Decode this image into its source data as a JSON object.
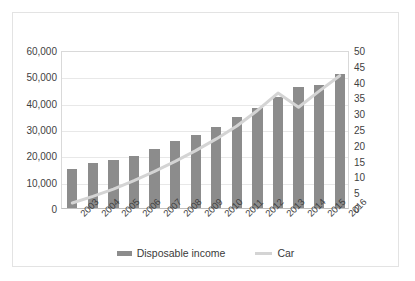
{
  "chart_data": {
    "type": "bar",
    "title": "",
    "xlabel": "",
    "ylabel": "",
    "grid": true,
    "legend_position": "bottom-center",
    "categories": [
      "2003",
      "2004",
      "2005",
      "2006",
      "2007",
      "2008",
      "2009",
      "2010",
      "2011",
      "2012",
      "2013",
      "2014",
      "2015",
      "2016"
    ],
    "axes": {
      "left": {
        "label": "",
        "ylim": [
          0,
          60000
        ],
        "step": 10000,
        "ticks": [
          "0",
          "10,000",
          "20,000",
          "30,000",
          "40,000",
          "50,000",
          "60,000"
        ],
        "tick_values": [
          0,
          10000,
          20000,
          30000,
          40000,
          50000,
          60000
        ]
      },
      "right": {
        "label": "",
        "ylim": [
          0,
          50
        ],
        "step": 5,
        "ticks": [
          "0",
          "5",
          "10",
          "15",
          "20",
          "25",
          "30",
          "35",
          "40",
          "45",
          "50"
        ],
        "tick_values": [
          0,
          5,
          10,
          15,
          20,
          25,
          30,
          35,
          40,
          45,
          50
        ]
      }
    },
    "series": [
      {
        "name": "Disposable income",
        "type": "bar",
        "axis": "left",
        "color": "#8c8c8c",
        "values": [
          15000,
          17000,
          18300,
          19800,
          22500,
          25300,
          27700,
          30800,
          34400,
          38000,
          42100,
          45800,
          46800,
          51000
        ]
      },
      {
        "name": "Car",
        "type": "line",
        "axis": "right",
        "color": "#d4d4d4",
        "values": [
          2.2,
          4.3,
          6.6,
          9.3,
          12.2,
          15.4,
          18.8,
          22.5,
          26.6,
          31.5,
          37.0,
          32.5,
          37.6,
          42.5
        ]
      }
    ]
  },
  "legend": {
    "items": [
      {
        "label": "Disposable income",
        "marker": "bar-swatch"
      },
      {
        "label": "Car",
        "marker": "line-swatch"
      }
    ]
  },
  "colors": {
    "bar": "#8c8c8c",
    "line": "#d4d4d4",
    "gridline": "#e8e8e8",
    "axis": "#bfbfbf",
    "frame": "#e3e3e3",
    "text": "#3a3a3a",
    "background": "#ffffff"
  }
}
